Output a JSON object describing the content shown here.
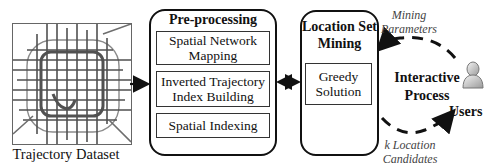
{
  "diagram": {
    "dataset": {
      "caption": "Trajectory Dataset",
      "icon": "road-network-map"
    },
    "preprocessing": {
      "title": "Pre-processing",
      "steps": [
        {
          "label": "Spatial Network Mapping",
          "line1": "Spatial Network",
          "line2": "Mapping"
        },
        {
          "label": "Inverted Trajectory Index Building",
          "line1": "Inverted Trajectory",
          "line2": "Index Building"
        },
        {
          "label": "Spatial Indexing",
          "line1": "Spatial Indexing"
        }
      ]
    },
    "mining": {
      "title_line1": "Location Set",
      "title_line2": "Mining",
      "method_line1": "Greedy",
      "method_line2": "Solution"
    },
    "interactive": {
      "line1": "Interactive",
      "line2": "Process",
      "user_label": "Users",
      "user_icon": "user-icon",
      "input_line1": "Mining",
      "input_line2": "Parameters",
      "output_line1": "k Location",
      "output_line2": "Candidates"
    },
    "edges": [
      {
        "from": "Trajectory Dataset",
        "to": "Pre-processing",
        "type": "arrow"
      },
      {
        "from": "Pre-processing",
        "to": "Location Set Mining",
        "type": "bidirectional-arrow"
      },
      {
        "from": "Users",
        "to": "Location Set Mining",
        "type": "dashed-arc",
        "label": "Mining Parameters"
      },
      {
        "from": "Location Set Mining",
        "to": "Users",
        "type": "dashed-arc",
        "label": "k Location Candidates"
      }
    ]
  }
}
